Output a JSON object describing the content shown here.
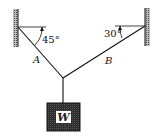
{
  "diagram": {
    "type": "statics-free-body",
    "ropes": [
      {
        "label": "A",
        "angle": "45°"
      },
      {
        "label": "B",
        "angle": "30°"
      }
    ],
    "weight": {
      "label": "W"
    },
    "colors": {
      "line": "#111111",
      "box": "#3a3a3a",
      "hatch": "#777777",
      "label_bg": "#ffffff"
    }
  }
}
